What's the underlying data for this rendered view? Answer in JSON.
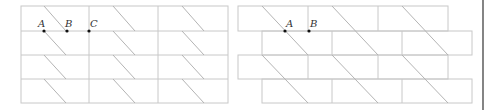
{
  "colors": {
    "grid_line": "#c8c8c8",
    "diagonal": "#b4b4b4",
    "point": "#111111",
    "label": "#333333",
    "border": "#333333"
  },
  "figures": [
    {
      "name": "rectangular-grid",
      "description": "3 columns x 4 rows aligned grid with one diagonal per cell",
      "points": [
        {
          "label": "A",
          "x": 44,
          "y": 31
        },
        {
          "label": "B",
          "x": 67,
          "y": 31
        },
        {
          "label": "C",
          "x": 89,
          "y": 31
        }
      ]
    },
    {
      "name": "brick-grid",
      "description": "brick pattern, rows alternately offset, diagonals spanning two rows",
      "points": [
        {
          "label": "A",
          "x": 285,
          "y": 31
        },
        {
          "label": "B",
          "x": 309,
          "y": 31
        }
      ]
    }
  ],
  "labels": {
    "left_a": "A",
    "left_b": "B",
    "left_c": "C",
    "right_a": "A",
    "right_b": "B"
  }
}
